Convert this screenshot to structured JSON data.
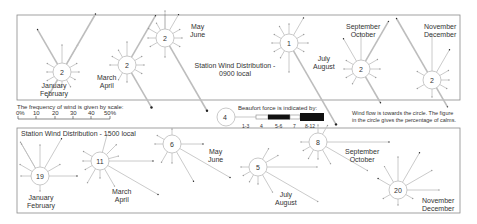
{
  "panels": {
    "morning": {
      "title_line1": "Station Wind Distribution -",
      "title_line2": "0900 local",
      "roses": [
        {
          "period": "January February",
          "label1": "January",
          "label2": "February",
          "calm": "2",
          "cx": 62,
          "cy": 72,
          "r": 9,
          "lx": 40,
          "ly": 82,
          "spokes": [
            [
              -90,
              18,
              1
            ],
            [
              -60,
              22,
              2
            ],
            [
              -30,
              8,
              1
            ],
            [
              0,
              8,
              1
            ],
            [
              30,
              6,
              1
            ],
            [
              60,
              8,
              1
            ],
            [
              90,
              6,
              1
            ],
            [
              120,
              20,
              3
            ],
            [
              150,
              8,
              1
            ],
            [
              180,
              6,
              1
            ],
            [
              210,
              8,
              1
            ],
            [
              240,
              40,
              3
            ],
            [
              300,
              58,
              3
            ]
          ]
        },
        {
          "period": "March April",
          "label1": "March",
          "label2": "April",
          "calm": "2",
          "cx": 127,
          "cy": 65,
          "r": 9,
          "lx": 97,
          "ly": 74,
          "spokes": [
            [
              -90,
              14,
              1
            ],
            [
              -30,
              8,
              1
            ],
            [
              0,
              8,
              1
            ],
            [
              30,
              8,
              1
            ],
            [
              60,
              40,
              4
            ],
            [
              90,
              8,
              1
            ],
            [
              120,
              8,
              1
            ],
            [
              180,
              8,
              1
            ],
            [
              210,
              8,
              1
            ],
            [
              240,
              8,
              1
            ],
            [
              300,
              48,
              3
            ]
          ]
        },
        {
          "period": "May June",
          "label1": "May",
          "label2": "June",
          "calm": "2",
          "cx": 165,
          "cy": 38,
          "r": 9,
          "lx": 190,
          "ly": 23,
          "spokes": [
            [
              -90,
              18,
              1
            ],
            [
              -60,
              18,
              2
            ],
            [
              -30,
              8,
              1
            ],
            [
              0,
              8,
              1
            ],
            [
              30,
              8,
              1
            ],
            [
              60,
              75,
              4
            ],
            [
              90,
              10,
              1
            ],
            [
              150,
              8,
              1
            ],
            [
              180,
              8,
              1
            ],
            [
              210,
              10,
              1
            ],
            [
              240,
              8,
              1
            ],
            [
              270,
              14,
              1
            ]
          ]
        },
        {
          "period": "July August",
          "label1": "July",
          "label2": "August",
          "calm": "1",
          "cx": 289,
          "cy": 43,
          "r": 9,
          "lx": 313,
          "ly": 55,
          "spokes": [
            [
              -90,
              10,
              1
            ],
            [
              -60,
              20,
              2
            ],
            [
              -30,
              8,
              1
            ],
            [
              0,
              10,
              1
            ],
            [
              30,
              8,
              1
            ],
            [
              60,
              85,
              4
            ],
            [
              90,
              20,
              1
            ],
            [
              120,
              8,
              1
            ],
            [
              150,
              8,
              1
            ],
            [
              180,
              8,
              1
            ],
            [
              210,
              8,
              1
            ],
            [
              240,
              10,
              1
            ]
          ]
        },
        {
          "period": "September October",
          "label1": "September",
          "label2": "October",
          "calm": "2",
          "cx": 361,
          "cy": 69,
          "r": 9,
          "lx": 346,
          "ly": 23,
          "spokes": [
            [
              -90,
              26,
              1
            ],
            [
              -60,
              46,
              3
            ],
            [
              -30,
              10,
              1
            ],
            [
              0,
              10,
              1
            ],
            [
              30,
              8,
              1
            ],
            [
              60,
              30,
              3
            ],
            [
              120,
              8,
              1
            ],
            [
              150,
              8,
              1
            ],
            [
              180,
              8,
              1
            ],
            [
              210,
              8,
              1
            ],
            [
              240,
              26,
              2
            ]
          ]
        },
        {
          "period": "November December",
          "label1": "November",
          "label2": "December",
          "calm": "2",
          "cx": 432,
          "cy": 80,
          "r": 9,
          "lx": 424,
          "ly": 23,
          "spokes": [
            [
              -90,
              36,
              1
            ],
            [
              -60,
              26,
              2
            ],
            [
              -30,
              10,
              1
            ],
            [
              0,
              8,
              1
            ],
            [
              30,
              8,
              1
            ],
            [
              60,
              22,
              3
            ],
            [
              90,
              8,
              1
            ],
            [
              150,
              8,
              1
            ],
            [
              210,
              8,
              1
            ],
            [
              240,
              62,
              3
            ]
          ]
        }
      ]
    },
    "afternoon": {
      "title": "Station Wind Distribution - 1500 local",
      "roses": [
        {
          "period": "January February",
          "label1": "January",
          "label2": "February",
          "calm": "19",
          "cx": 40,
          "cy": 176,
          "r": 9,
          "lx": 27,
          "ly": 194,
          "spokes": [
            [
              -120,
              30,
              1
            ],
            [
              -90,
              22,
              1
            ],
            [
              -60,
              34,
              2
            ],
            [
              -30,
              14,
              1
            ],
            [
              0,
              28,
              2
            ],
            [
              90,
              6,
              1
            ],
            [
              180,
              10,
              1
            ],
            [
              210,
              14,
              1
            ],
            [
              240,
              28,
              1
            ]
          ]
        },
        {
          "period": "March April",
          "label1": "March",
          "label2": "April",
          "calm": "11",
          "cx": 100,
          "cy": 161,
          "r": 9,
          "lx": 112,
          "ly": 188,
          "spokes": [
            [
              -75,
              18,
              1
            ],
            [
              -45,
              14,
              1
            ],
            [
              -15,
              10,
              1
            ],
            [
              0,
              44,
              2
            ],
            [
              30,
              58,
              2
            ],
            [
              60,
              20,
              1
            ],
            [
              90,
              8,
              1
            ],
            [
              120,
              16,
              1
            ],
            [
              150,
              8,
              1
            ],
            [
              180,
              8,
              1
            ],
            [
              210,
              10,
              1
            ]
          ]
        },
        {
          "period": "May June",
          "label1": "May",
          "label2": "June",
          "calm": "6",
          "cx": 172,
          "cy": 144,
          "r": 9,
          "lx": 208,
          "ly": 148,
          "spokes": [
            [
              -90,
              6,
              1
            ],
            [
              0,
              22,
              2
            ],
            [
              30,
              58,
              2
            ],
            [
              60,
              34,
              2
            ],
            [
              90,
              10,
              1
            ],
            [
              120,
              12,
              1
            ],
            [
              180,
              8,
              1
            ],
            [
              210,
              8,
              1
            ]
          ]
        },
        {
          "period": "July August",
          "label1": "July",
          "label2": "August",
          "calm": "5",
          "cx": 258,
          "cy": 167,
          "r": 9,
          "lx": 275,
          "ly": 191,
          "spokes": [
            [
              -60,
              12,
              1
            ],
            [
              -30,
              14,
              1
            ],
            [
              0,
              50,
              1
            ],
            [
              30,
              60,
              1
            ],
            [
              60,
              20,
              1
            ],
            [
              90,
              8,
              1
            ],
            [
              120,
              8,
              1
            ],
            [
              150,
              8,
              1
            ],
            [
              180,
              8,
              1
            ]
          ]
        },
        {
          "period": "September October",
          "label1": "September",
          "label2": "October",
          "calm": "8",
          "cx": 318,
          "cy": 142,
          "r": 9,
          "lx": 345,
          "ly": 148,
          "spokes": [
            [
              -60,
              10,
              1
            ],
            [
              -90,
              8,
              1
            ],
            [
              0,
              62,
              2
            ],
            [
              30,
              48,
              1
            ],
            [
              60,
              16,
              1
            ],
            [
              90,
              8,
              1
            ],
            [
              120,
              10,
              1
            ],
            [
              150,
              8,
              1
            ],
            [
              180,
              8,
              1
            ]
          ]
        },
        {
          "period": "November December",
          "label1": "November",
          "label2": "December",
          "calm": "20",
          "cx": 398,
          "cy": 190,
          "r": 9,
          "lx": 422,
          "ly": 197,
          "spokes": [
            [
              -120,
              18,
              1
            ],
            [
              -90,
              24,
              1
            ],
            [
              -60,
              34,
              2
            ],
            [
              -30,
              30,
              1
            ],
            [
              0,
              32,
              1
            ],
            [
              30,
              8,
              1
            ],
            [
              90,
              6,
              1
            ],
            [
              150,
              8,
              1
            ],
            [
              210,
              14,
              2
            ]
          ]
        }
      ]
    }
  },
  "legend": {
    "frequency_text": "The frequency of wind is given by scale:",
    "frequency_ticks": [
      "0%",
      "10",
      "20",
      "30",
      "40",
      "50%"
    ],
    "beaufort_text": "Beaufort force is indicated by:",
    "beaufort_sample_value": "4",
    "beaufort_labels": [
      "1-3",
      "4",
      "5-6",
      "7",
      "8-12"
    ],
    "flow_note_line1": "Wind flow is towards the circle.  The figure",
    "flow_note_line2": "in the circle gives the percentage of calms."
  },
  "colors": {
    "line": "#b8b8b8",
    "box": "#8a8a8a",
    "text": "#333333",
    "fill_dark": "#111111"
  }
}
